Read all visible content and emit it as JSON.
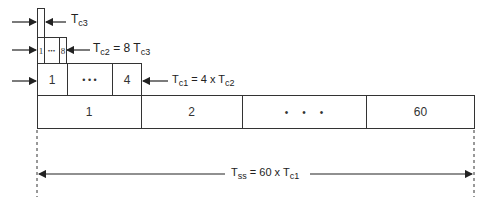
{
  "diagram": {
    "type": "hierarchical-timing-frame",
    "levels": {
      "tc3": {
        "label_main": "T",
        "label_sub": "c3"
      },
      "tc2": {
        "cells": [
          "1",
          "•••",
          "8"
        ],
        "label_main": "T",
        "label_sub": "c2",
        "label_eq": " = 8 T",
        "label_eq_sub": "c3"
      },
      "tc1": {
        "cells": [
          "1",
          "• • •",
          "4"
        ],
        "label_main": "T",
        "label_sub": "c1",
        "label_eq": " = 4 x T",
        "label_eq_sub": "c2"
      },
      "superframe": {
        "cells": [
          "1",
          "2",
          "•     •     •",
          "60"
        ]
      }
    },
    "span": {
      "label_main": "T",
      "label_sub": "ss",
      "label_eq": " = 60 x T",
      "label_eq_sub": "c1"
    },
    "colors": {
      "line": "#333333",
      "background": "#ffffff"
    }
  }
}
